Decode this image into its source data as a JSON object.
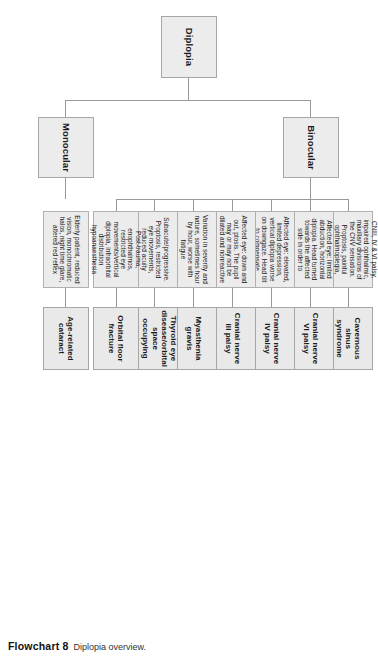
{
  "figure": {
    "caption_label": "Flowchart 8",
    "caption_text": "Diplopia overview."
  },
  "root": {
    "label": "Diplopia"
  },
  "branches": [
    {
      "id": "monocular",
      "label": "Monocular"
    },
    {
      "id": "binocular",
      "label": "Binocular"
    }
  ],
  "columns": [
    {
      "id": "age-related-cataract",
      "branch": "monocular",
      "description": "Elderly patient, reduced vision, monochromatic halos, night time glare, altered red reflex",
      "diagnosis": "Age-related cataract"
    },
    {
      "id": "orbital-floor-fracture",
      "branch": "binocular",
      "description": "Post-trauma, enophthalmos, restricted eye movements/vertical diplopia, infraorbital distribution hypoanaesthesia",
      "diagnosis": "Orbital floor fracture"
    },
    {
      "id": "thyroid-eye-disease",
      "branch": "binocular",
      "description": "Subacute/progressive. Proptosis, restricted eye movements, reduced acuity",
      "diagnosis": "Thyroid eye disease/orbital space occupying lesion"
    },
    {
      "id": "myasthenia-gravis",
      "branch": "binocular",
      "description": "Variation in severity and nature, sometimes hour by hour, worse with fatigue",
      "diagnosis": "Myasthenia gravis"
    },
    {
      "id": "cranial-nerve-iii-palsy",
      "branch": "binocular",
      "description": "Affected eye: down and out, ptosis. The pupil may or may not be dilated and nonreactive",
      "diagnosis": "Cranial nerve III palsy"
    },
    {
      "id": "cranial-nerve-iv-palsy",
      "branch": "binocular",
      "description": "Affected eye: elevated, limited depression, vertical diplopia worse on downgaze. Head tilt to compensate",
      "diagnosis": "Cranial nerve IV palsy"
    },
    {
      "id": "cranial-nerve-vi-palsy",
      "branch": "binocular",
      "description": "Affected eye: limited abduction, horizontal diplopia. Head turned towards the affected side in order to compensate",
      "diagnosis": "Cranial nerve VI palsy"
    },
    {
      "id": "cavernous-sinus-syndrome",
      "branch": "binocular",
      "description": "CNIII, IV & VI palsy, impaired ophthalmic, maxillary divisions of the CNV sensation. Proptosis, painful ophthalmoplegia, nonreactive, mid-dilated pupil. Ptosis",
      "diagnosis": "Cavernous sinus syndrome"
    }
  ]
}
